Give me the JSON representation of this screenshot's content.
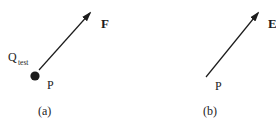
{
  "colors": {
    "background": "#ffffff",
    "ink": "#1c1c1c"
  },
  "figure": {
    "description_type": "vector-diagram",
    "panels": [
      {
        "caption": "(a)",
        "vector_label": "F",
        "point_label": "P",
        "charge_label": "Q",
        "charge_label_subscript": "test",
        "arrow": {
          "x1": 39,
          "y1": 70,
          "x2": 90,
          "y2": 13
        },
        "dot": {
          "cx": 35,
          "cy": 76,
          "r": 4.6
        }
      },
      {
        "caption": "(b)",
        "vector_label": "E",
        "point_label": "P",
        "arrow": {
          "x1": 206,
          "y1": 77,
          "x2": 258,
          "y2": 13
        }
      }
    ]
  }
}
